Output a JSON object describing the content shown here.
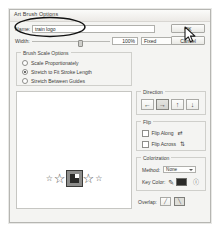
{
  "dialog": {
    "title": "Art Brush Options",
    "buttons": {
      "ok": "OK",
      "cancel": "Cancel"
    },
    "name": {
      "label": "Name:",
      "value": "train logo",
      "placeholder": ""
    },
    "width": {
      "label": "Width:",
      "percent": "100%",
      "mode": "Fixed",
      "mode_options": [
        "Fixed",
        "Random",
        "Pressure",
        "Stylus Wheel",
        "Tilt",
        "Bearing",
        "Rotation"
      ]
    },
    "scale_options": {
      "title": "Brush Scale Options",
      "items": [
        {
          "label": "Scale Proportionately",
          "selected": false
        },
        {
          "label": "Stretch to Fit Stroke Length",
          "selected": true
        },
        {
          "label": "Stretch Between Guides",
          "selected": false
        }
      ]
    },
    "preview": {
      "name": "brush-art-preview",
      "stars": 5
    },
    "direction": {
      "title": "Direction",
      "buttons": [
        {
          "icon": "arrow-left-icon",
          "glyph": "←",
          "selected": false
        },
        {
          "icon": "arrow-right-icon",
          "glyph": "→",
          "selected": true
        },
        {
          "icon": "arrow-up-icon",
          "glyph": "↑",
          "selected": false
        },
        {
          "icon": "arrow-down-icon",
          "glyph": "↓",
          "selected": false
        }
      ]
    },
    "flip": {
      "title": "Flip",
      "items": [
        {
          "label": "Flip Along",
          "checked": false,
          "icon": "flip-along-icon",
          "glyph": "⇄"
        },
        {
          "label": "Flip Across",
          "checked": false,
          "icon": "flip-across-icon",
          "glyph": "⇅"
        }
      ]
    },
    "colorization": {
      "title": "Colorization",
      "method_label": "Method:",
      "method_value": "None",
      "method_options": [
        "None",
        "Tints",
        "Tints and Shades",
        "Hue Shift"
      ],
      "key_color_label": "Key Color:",
      "key_color_hex": "#2a2a28",
      "eyedropper_icon": "eyedropper-icon",
      "help_icon": "help-icon"
    },
    "overlap": {
      "label": "Overlap:",
      "buttons": [
        {
          "icon": "overlap-allow-icon",
          "selected": false
        },
        {
          "icon": "overlap-prevent-icon",
          "selected": true
        }
      ]
    }
  },
  "annotation": {
    "name": "ellipse-highlight",
    "target": "name-field"
  },
  "cursor": {
    "name": "mouse-pointer",
    "over": "ok-button"
  }
}
